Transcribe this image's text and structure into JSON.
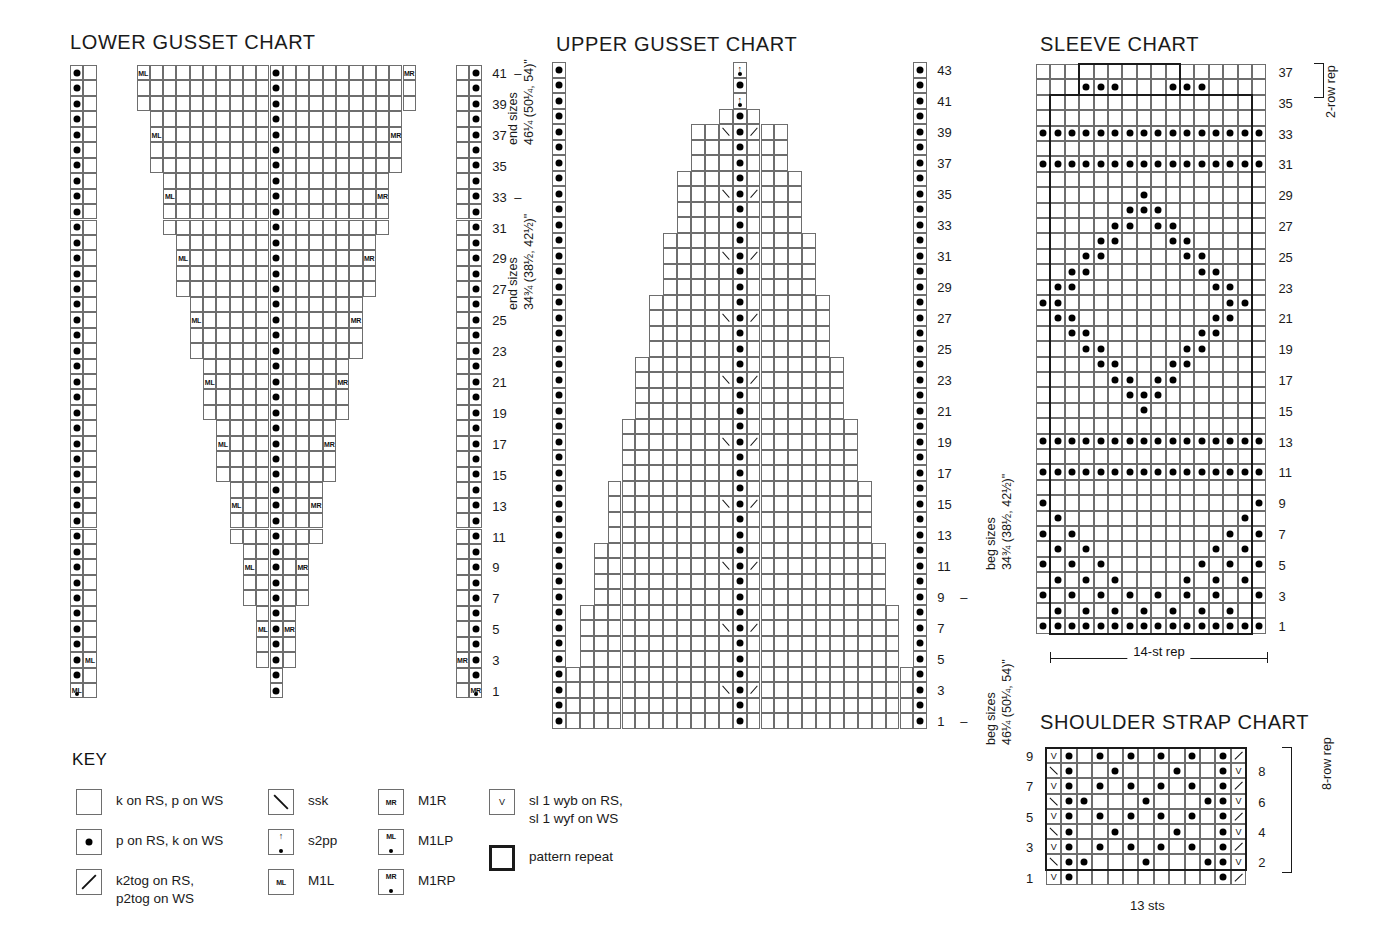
{
  "charts": {
    "lower_gusset": {
      "title": "LOWER GUSSET CHART",
      "row_numbers": [
        41,
        39,
        37,
        35,
        33,
        31,
        29,
        27,
        25,
        23,
        21,
        19,
        17,
        15,
        13,
        11,
        9,
        7,
        5,
        3,
        1
      ],
      "side_labels": [
        "end sizes\n46¼ (50¼, 54)\"",
        "end sizes\n34¾ (38½, 42½)\""
      ],
      "side_label_1_line1": "end sizes",
      "side_label_1_line2": "46¼ (50¼, 54)\"",
      "side_label_2_line1": "end sizes",
      "side_label_2_line2": "34¾ (38½, 42½)\"",
      "symbols": {
        "m1l": "ML",
        "m1r": "MR"
      }
    },
    "upper_gusset": {
      "title": "UPPER GUSSET CHART",
      "row_numbers": [
        43,
        41,
        39,
        37,
        35,
        33,
        31,
        29,
        27,
        25,
        23,
        21,
        19,
        17,
        15,
        13,
        11,
        9,
        7,
        5,
        3,
        1
      ],
      "side_label_1_line1": "beg sizes",
      "side_label_1_line2": "34¾ (38½, 42½)\"",
      "side_label_2_line1": "beg sizes",
      "side_label_2_line2": "46¼ (50¼, 54)\""
    },
    "sleeve": {
      "title": "SLEEVE CHART",
      "row_numbers": [
        37,
        35,
        33,
        31,
        29,
        27,
        25,
        23,
        21,
        19,
        17,
        15,
        13,
        11,
        9,
        7,
        5,
        3,
        1
      ],
      "rep_label": "14-st rep",
      "row_rep_label": "2-row rep"
    },
    "shoulder_strap": {
      "title": "SHOULDER STRAP CHART",
      "left_row_numbers": [
        9,
        7,
        5,
        3,
        1
      ],
      "right_row_numbers": [
        8,
        6,
        4,
        2
      ],
      "sts_label": "13 sts",
      "row_rep_label": "8-row rep"
    }
  },
  "key": {
    "title": "KEY",
    "items": [
      {
        "symbol": "blank",
        "label": "k on RS, p on WS"
      },
      {
        "symbol": "purl",
        "label": "p on RS, k on WS"
      },
      {
        "symbol": "k2tog",
        "label": "k2tog on RS,\np2tog on WS"
      },
      {
        "symbol": "ssk",
        "label": "ssk"
      },
      {
        "symbol": "s2pp",
        "label": "s2pp"
      },
      {
        "symbol": "m1l",
        "label": "M1L"
      },
      {
        "symbol": "m1r",
        "label": "M1R"
      },
      {
        "symbol": "m1lp",
        "label": "M1LP"
      },
      {
        "symbol": "m1rp",
        "label": "M1RP"
      },
      {
        "symbol": "sl1",
        "label": "sl 1 wyb on RS,\nsl 1 wyf on WS"
      },
      {
        "symbol": "repeat",
        "label": "pattern repeat"
      }
    ],
    "glyphs": {
      "m1l": "ML",
      "m1r": "MR",
      "m1lp": "ML",
      "m1rp": "MR",
      "sl1": "V",
      "s2pp": "↑"
    }
  },
  "chart_data": {
    "type": "table",
    "legend": [
      "blank = k on RS, p on WS",
      "dot = p on RS, k on WS",
      "/ = k2tog on RS, p2tog on WS",
      "\\ = ssk",
      "arrow = s2pp",
      "ML = M1L",
      "MR = M1R",
      "ML+dot = M1LP",
      "MR+dot = M1RP",
      "V = sl 1 wyb on RS, sl 1 wyf on WS",
      "bold outline = pattern repeat"
    ],
    "lower_gusset": {
      "rows": 41,
      "cols": 31,
      "description": "Inverted-triangle gusset: a central purl column at col 16 flanked by widening stockinette wedges that grow from row 1 to row 41; M1L at the left edge of the wedge and M1R at the right edge every 4th row. Outer purl columns at col 1 and col 31 run the full height.",
      "center_purl_col": 16,
      "edge_purl_cols": [
        1,
        31
      ],
      "increase_rows": [
        1,
        3,
        5,
        9,
        13,
        17,
        21,
        25,
        29,
        33,
        37,
        41
      ]
    },
    "upper_gusset": {
      "rows": 43,
      "cols": 27,
      "description": "Pyramid/triangle decreasing gusset: a central purl column at col 14 with ssk on its left and k2tog on its right every 4th row, the stockinette field narrowing from the full width at row 1 to a point at row 43, topped by two s2pp. Outer purl columns at col 1 and col 27 run the full height.",
      "center_purl_col": 14,
      "edge_purl_cols": [
        1,
        27
      ],
      "decrease_rows": [
        3,
        7,
        11,
        15,
        19,
        23,
        27,
        31,
        35,
        39
      ],
      "s2pp_rows": [
        41,
        43
      ]
    },
    "sleeve": {
      "rows": 37,
      "cols": 16,
      "rep_sts": 14,
      "row_rep": 2,
      "description": "Sleeve lattice/diamond motif worked over a 14-st repeat (cols 2–15) with a 2-row repeat at rows 36–37. Full purl ridge rows at rows 2, 12, 14, 32, 34; a large travelling diamond of purl stitches between rows 3 and 31."
    },
    "shoulder_strap": {
      "rows": 9,
      "cols": 13,
      "sts": 13,
      "row_rep": 8,
      "description": "13-stitch strap with slipped selvedge: col 1 alternates V (sl 1) on odd rows and ssk on even rows; col 13 alternates k2tog on odd rows and V on even rows. Cols 2 and 12 are purl every row; interior purl dots form a small zig-zag lattice. Rows 2–9 form the 8-row repeat."
    }
  }
}
